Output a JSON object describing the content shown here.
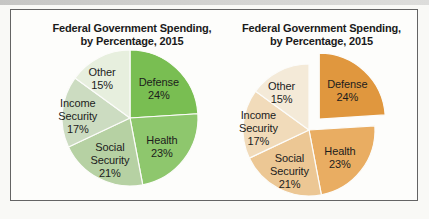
{
  "figure_frame": {
    "border_color": "#646464",
    "background": "#fdfdfb"
  },
  "chart_data": [
    {
      "type": "pie",
      "title": "Federal Government Spending, by Percentage, 2015",
      "title_lines": [
        "Federal Government Spending,",
        "by Percentage, 2015"
      ],
      "categories": [
        "Defense",
        "Health",
        "Social Security",
        "Income Security",
        "Other"
      ],
      "values": [
        24,
        23,
        21,
        17,
        15
      ],
      "unit": "%",
      "slice_labels": [
        "Defense 24%",
        "Health 23%",
        "Social Security 21%",
        "Income Security 17%",
        "Other 15%"
      ],
      "colors": [
        "#79BE52",
        "#8EC76D",
        "#B6D1A3",
        "#CCDCC1",
        "#E7EFDE"
      ],
      "color_theme": "green",
      "start_angle_deg": 0,
      "direction": "clockwise",
      "exploded_slice": null,
      "label_color": "#1c1c1c",
      "legend": "none"
    },
    {
      "type": "pie",
      "title": "Federal Government Spending, by Percentage, 2015",
      "title_lines": [
        "Federal Government Spending,",
        "by Percentage, 2015"
      ],
      "categories": [
        "Defense",
        "Health",
        "Social Security",
        "Income Security",
        "Other"
      ],
      "values": [
        24,
        23,
        21,
        17,
        15
      ],
      "unit": "%",
      "slice_labels": [
        "Defense 24%",
        "Health 23%",
        "Social Security 21%",
        "Income Security 17%",
        "Other 15%"
      ],
      "colors": [
        "#E0973E",
        "#E9AD62",
        "#ECC794",
        "#F1DBBA",
        "#F4EAD8"
      ],
      "color_theme": "orange",
      "start_angle_deg": 0,
      "direction": "clockwise",
      "exploded_slice": "Defense",
      "label_color": "#1c1c1c",
      "legend": "none"
    }
  ]
}
